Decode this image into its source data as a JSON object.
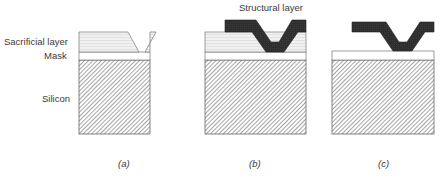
{
  "labels": {
    "sacrificial_layer": "Sacrificial layer",
    "mask": "Mask",
    "silicon": "Silicon",
    "structural_layer": "Structural layer"
  },
  "panels": [
    {
      "id": "a",
      "caption": "(a)"
    },
    {
      "id": "b",
      "caption": "(b)"
    },
    {
      "id": "c",
      "caption": "(c)"
    }
  ],
  "colors": {
    "structural": "#2b2b2b",
    "sacrificial_fill": "#eeeeee",
    "sacrificial_lines": "#cfcfcf",
    "mask_fill": "#ffffff",
    "silicon_hatch": "#555555",
    "outline": "#666666"
  }
}
